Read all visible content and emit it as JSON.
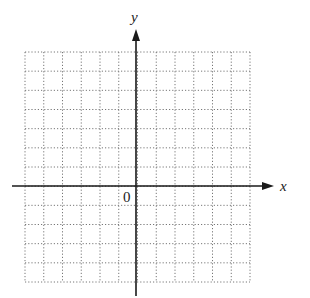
{
  "diagram": {
    "type": "coordinate-grid",
    "x_axis_label": "x",
    "y_axis_label": "y",
    "origin_label": "0",
    "grid": {
      "columns": 12,
      "rows": 12,
      "line_style": "dotted",
      "left_units": 6,
      "right_units": 6,
      "up_units": 7,
      "down_units": 5
    },
    "colors": {
      "axis": "#1a1a1a",
      "grid": "#777777",
      "background": "#ffffff"
    }
  }
}
